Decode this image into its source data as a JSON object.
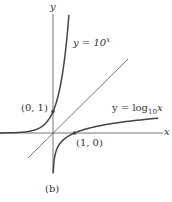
{
  "chart_data": {
    "type": "line",
    "title": "",
    "caption": "(b)",
    "xlabel": "x",
    "ylabel": "y",
    "grid": false,
    "axis_range": {
      "x": [
        -2.5,
        5.1
      ],
      "y": [
        -2.0,
        5.8
      ]
    },
    "series": [
      {
        "name": "y = 10^x",
        "function": "10^x",
        "x": [
          -2.5,
          -1,
          -0.5,
          0,
          0.3,
          0.6,
          0.75
        ],
        "y": [
          0.003,
          0.1,
          0.316,
          1,
          2,
          3.98,
          5.6
        ]
      },
      {
        "name": "y = log10 x",
        "function": "log10(x)",
        "x": [
          0.003,
          0.1,
          0.316,
          1,
          2,
          3.98,
          5.1
        ],
        "y": [
          -2.5,
          -1,
          -0.5,
          0,
          0.3,
          0.6,
          0.71
        ]
      },
      {
        "name": "y = x",
        "function": "x",
        "x": [
          -1.15,
          3.5
        ],
        "y": [
          -1.15,
          3.5
        ]
      }
    ],
    "annotations": [
      {
        "text": "(0, 1)",
        "x": 0,
        "y": 1
      },
      {
        "text": "(1, 0)",
        "x": 1,
        "y": 0
      }
    ],
    "labels": {
      "exp": {
        "prefix": "y = 10",
        "sup": "x"
      },
      "log": {
        "prefix": "y = log",
        "sub": "10",
        "suffix": "x"
      },
      "point_01": "(0, 1)",
      "point_10": "(1, 0)",
      "x_axis": "x",
      "y_axis": "y",
      "caption": "(b)"
    }
  },
  "colors": {
    "axis": "#555555",
    "curve": "#444444",
    "text": "#333333"
  }
}
